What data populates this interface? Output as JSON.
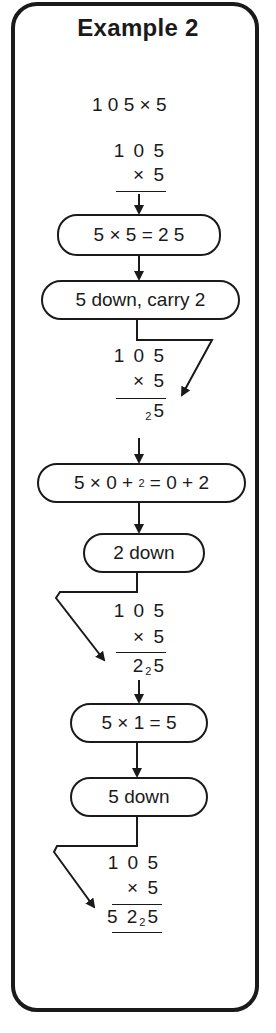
{
  "title": "Example 2",
  "problem": "1 0 5 × 5",
  "stages": [
    {
      "top": "1 0 5",
      "mult": "× 5",
      "result_main": "",
      "result_sub": "",
      "result_tail": ""
    },
    {
      "top": "1 0 5",
      "mult": "× 5",
      "result_main": "",
      "result_sub": "2",
      "result_tail": "5"
    },
    {
      "top": "1 0 5",
      "mult": "× 5",
      "result_main": "2",
      "result_sub": "2",
      "result_tail": "5"
    },
    {
      "top": "1 0 5",
      "mult": "× 5",
      "result_main": "5 2",
      "result_sub": "2",
      "result_tail": "5"
    }
  ],
  "steps": [
    {
      "label": "5 × 5 = 2 5"
    },
    {
      "label": "5 down, carry 2"
    },
    {
      "label_pre": "5 × 0 + ",
      "label_sub": "2",
      "label_post": " = 0 + 2"
    },
    {
      "label": "2 down"
    },
    {
      "label": "5 × 1 = 5"
    },
    {
      "label": "5 down"
    }
  ],
  "colors": {
    "ink": "#1a1a1a",
    "paper": "#ffffff"
  }
}
